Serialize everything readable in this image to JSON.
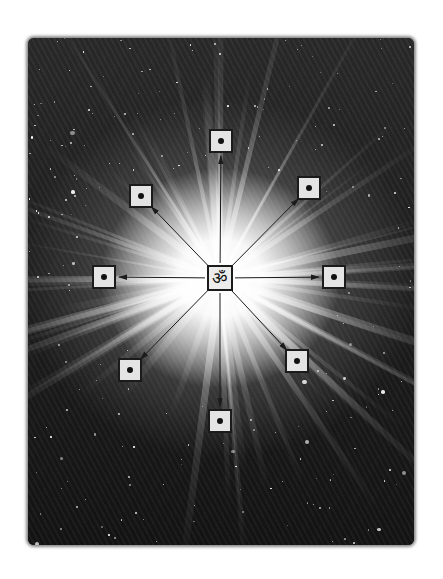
{
  "illustration": {
    "subject": "om-radiating-into-cosmos",
    "center_symbol": "ॐ",
    "colors": {
      "background": "#ffffff",
      "space": "#1a1a1a",
      "glow": "#ffffff",
      "node_fill": "#e4e4e4",
      "node_border": "#1b1b1b",
      "arrow": "#1b1b1b"
    },
    "center": {
      "x": 220,
      "y": 278
    },
    "nodes": [
      {
        "id": "top",
        "x": 221,
        "y": 141
      },
      {
        "id": "top-right",
        "x": 309,
        "y": 188
      },
      {
        "id": "right",
        "x": 334,
        "y": 277
      },
      {
        "id": "bottom-right",
        "x": 297,
        "y": 361
      },
      {
        "id": "bottom",
        "x": 220,
        "y": 421
      },
      {
        "id": "bottom-left",
        "x": 130,
        "y": 370
      },
      {
        "id": "left",
        "x": 104,
        "y": 277
      },
      {
        "id": "top-left",
        "x": 141,
        "y": 196
      }
    ]
  }
}
